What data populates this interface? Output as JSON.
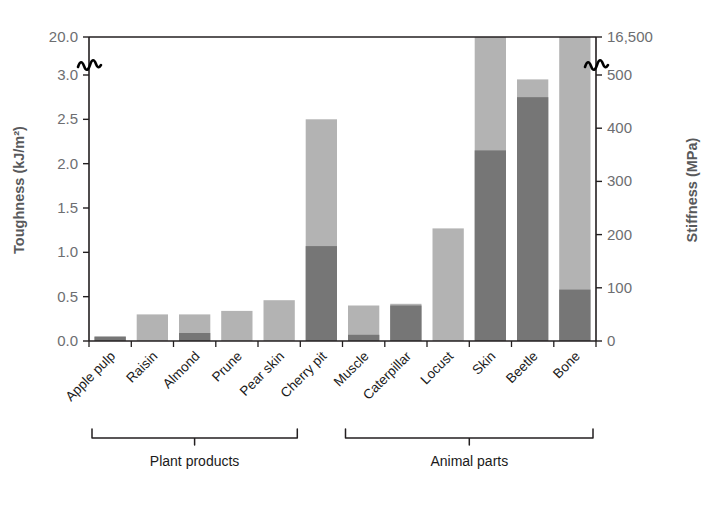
{
  "chart_data": {
    "type": "bar",
    "title": "",
    "subtitle": "",
    "categories": [
      "Apple pulp",
      "Raisin",
      "Almond",
      "Prune",
      "Pear skin",
      "Cherry pit",
      "Muscle",
      "Caterpillar",
      "Locust",
      "Skin",
      "Beetle",
      "Bone"
    ],
    "series": [
      {
        "name": "Stiffness",
        "axis": "right",
        "color": "#b3b3b3",
        "unit": "MPa",
        "values_toughness_scale": [
          0.05,
          0.3,
          0.3,
          0.34,
          0.46,
          2.5,
          0.4,
          0.42,
          1.27,
          20.0,
          2.95,
          20.0
        ],
        "values": [
          8,
          50,
          50,
          56,
          76,
          412,
          66,
          69,
          209,
          16500,
          486,
          16500
        ]
      },
      {
        "name": "Toughness",
        "axis": "left",
        "color": "#767676",
        "unit": "kJ/m²",
        "values": [
          0.05,
          0.0,
          0.09,
          0.0,
          0.0,
          1.07,
          0.07,
          0.4,
          0.0,
          2.15,
          2.75,
          0.58
        ]
      }
    ],
    "ylabel": "Toughness (kJ/m²)",
    "y2label": "Stiffness (MPa)",
    "xlabel": "",
    "yticks": [
      "0.0",
      "0.5",
      "1.0",
      "1.5",
      "2.0",
      "2.5",
      "3.0",
      "20.0"
    ],
    "ytick_values": [
      0.0,
      0.5,
      1.0,
      1.5,
      2.0,
      2.5,
      3.0,
      20.0
    ],
    "y2ticks": [
      "0",
      "100",
      "200",
      "300",
      "400",
      "500",
      "16,500"
    ],
    "y2tick_values": [
      0,
      100,
      200,
      300,
      400,
      500,
      16500
    ],
    "ylim": [
      0.0,
      20.0
    ],
    "y2lim": [
      0,
      16500
    ],
    "axis_break": true,
    "axis_break_note": "broken axis between 3.0 and 20.0 (left) / 500 and 16,500 (right)",
    "grid": false,
    "legend": "none",
    "groups": [
      {
        "label": "Plant products",
        "from": 0,
        "to": 4
      },
      {
        "label": "Animal parts",
        "from": 6,
        "to": 11
      }
    ]
  },
  "colors": {
    "stiffness_bar": "#b3b3b3",
    "toughness_bar": "#767676",
    "axis": "#231f20",
    "tick_text": "#6d6e71",
    "axis_label": "#58595b",
    "category_text": "#1a1a1a",
    "background": "#ffffff"
  }
}
